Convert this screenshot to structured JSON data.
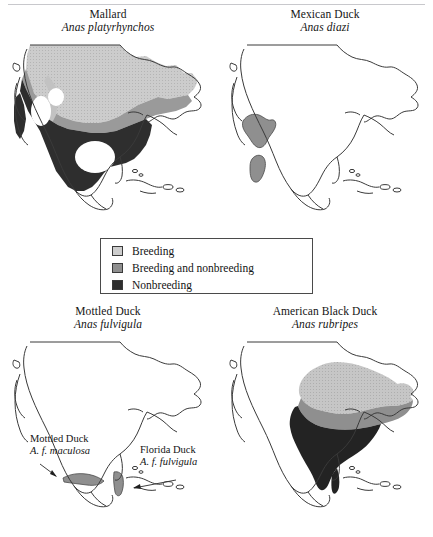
{
  "figure": {
    "kind": "range-map-figure",
    "legend": {
      "items": [
        {
          "label": "Breeding",
          "color": "#c9c9c9",
          "pattern": "stipple-light"
        },
        {
          "label": "Breeding and nonbreeding",
          "color": "#9a9a9a",
          "pattern": "solid-medium"
        },
        {
          "label": "Nonbreeding",
          "color": "#2e2e2e",
          "pattern": "solid-dark"
        }
      ]
    },
    "panels": [
      {
        "id": "mallard",
        "common_name": "Mallard",
        "scientific_name": "Anas platyrhynchos",
        "position": "top-left",
        "ranges": [
          "Breeding",
          "Breeding and nonbreeding",
          "Nonbreeding"
        ]
      },
      {
        "id": "mexican-duck",
        "common_name": "Mexican Duck",
        "scientific_name": "Anas diazi",
        "position": "top-right",
        "ranges": [
          "Breeding and nonbreeding"
        ]
      },
      {
        "id": "mottled-duck",
        "common_name": "Mottled Duck",
        "scientific_name": "Anas fulvigula",
        "position": "bottom-left",
        "ranges": [
          "Breeding and nonbreeding"
        ],
        "annotations": [
          {
            "id": "maculosa",
            "common_name": "Mottled Duck",
            "scientific_name": "A. f. maculosa"
          },
          {
            "id": "fulvigula",
            "common_name": "Florida Duck",
            "scientific_name": "A. f. fulvigula"
          }
        ]
      },
      {
        "id": "american-black-duck",
        "common_name": "American Black Duck",
        "scientific_name": "Anas rubripes",
        "position": "bottom-right",
        "ranges": [
          "Breeding",
          "Breeding and nonbreeding",
          "Nonbreeding"
        ]
      }
    ]
  },
  "colors": {
    "breeding": "#c9c9c9",
    "breeding_and_nonbreeding": "#9a9a9a",
    "nonbreeding": "#2e2e2e",
    "coastline": "#3a3a3a",
    "background": "#ffffff"
  }
}
